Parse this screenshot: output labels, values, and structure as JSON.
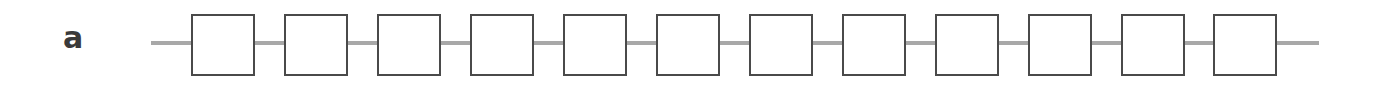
{
  "panel_label": "a",
  "diagram": {
    "type": "chain",
    "node_count": 12,
    "node_shape": "square",
    "wire_color": "#a8a8a8",
    "node_border_color": "#4a4a4a",
    "nodes": [
      {
        "index": 1,
        "x": 191
      },
      {
        "index": 2,
        "x": 284
      },
      {
        "index": 3,
        "x": 377
      },
      {
        "index": 4,
        "x": 470
      },
      {
        "index": 5,
        "x": 563
      },
      {
        "index": 6,
        "x": 656
      },
      {
        "index": 7,
        "x": 749
      },
      {
        "index": 8,
        "x": 842
      },
      {
        "index": 9,
        "x": 935
      },
      {
        "index": 10,
        "x": 1028
      },
      {
        "index": 11,
        "x": 1121
      },
      {
        "index": 12,
        "x": 1213
      }
    ]
  }
}
